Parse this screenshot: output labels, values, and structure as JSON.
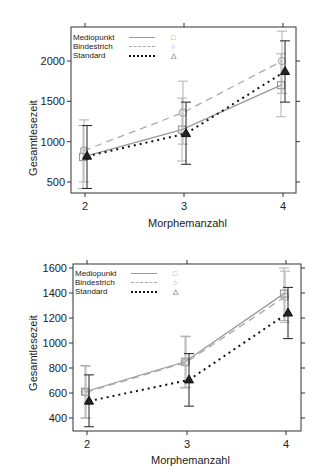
{
  "chart_data": [
    {
      "type": "line",
      "title": "",
      "xlabel": "Morphemanzahl",
      "ylabel": "Gesamtlesezeit",
      "x": [
        2,
        3,
        4
      ],
      "x_ticks": [
        "2",
        "3",
        "4"
      ],
      "y_ticks": [
        500,
        1000,
        1500,
        2000
      ],
      "ylim": [
        330,
        2390
      ],
      "grid": false,
      "legend_position": "top-left inside",
      "error_bars": true,
      "series": [
        {
          "name": "Mediopunkt",
          "line": "solid",
          "marker": "square",
          "color": "#999999",
          "values": [
            810,
            1150,
            1700
          ],
          "lower": [
            420,
            760,
            1310
          ],
          "upper": [
            1200,
            1540,
            2090
          ]
        },
        {
          "name": "Bindestrich",
          "line": "dashed",
          "marker": "circle",
          "color": "#aaaaaa",
          "values": [
            890,
            1360,
            2000
          ],
          "lower": [
            500,
            970,
            1600
          ],
          "upper": [
            1270,
            1750,
            2370
          ]
        },
        {
          "name": "Standard",
          "line": "dotted",
          "marker": "triangle",
          "color": "#111111",
          "values": [
            820,
            1100,
            1870
          ],
          "lower": [
            420,
            720,
            1490
          ],
          "upper": [
            1200,
            1490,
            2250
          ]
        }
      ]
    },
    {
      "type": "line",
      "title": "",
      "xlabel": "Morphemanzahl",
      "ylabel": "Gesamtlesezeit",
      "x": [
        2,
        3,
        4
      ],
      "x_ticks": [
        "2",
        "3",
        "4"
      ],
      "y_ticks": [
        400,
        600,
        800,
        1000,
        1200,
        1400,
        1600
      ],
      "ylim": [
        300,
        1630
      ],
      "grid": false,
      "legend_position": "top-left inside",
      "error_bars": true,
      "series": [
        {
          "name": "Mediopunkt",
          "line": "solid",
          "marker": "square",
          "color": "#999999",
          "values": [
            610,
            850,
            1395
          ],
          "lower": [
            400,
            640,
            1180
          ],
          "upper": [
            820,
            1055,
            1600
          ]
        },
        {
          "name": "Bindestrich",
          "line": "dashed",
          "marker": "circle",
          "color": "#aaaaaa",
          "values": [
            605,
            845,
            1370
          ],
          "lower": [
            400,
            645,
            1165
          ],
          "upper": [
            815,
            1050,
            1575
          ]
        },
        {
          "name": "Standard",
          "line": "dotted",
          "marker": "triangle",
          "color": "#111111",
          "values": [
            535,
            705,
            1240
          ],
          "lower": [
            330,
            495,
            1035
          ],
          "upper": [
            745,
            915,
            1445
          ]
        }
      ]
    }
  ],
  "legend": {
    "entries": [
      {
        "label": "Mediopunkt",
        "marker_glyph": "□"
      },
      {
        "label": "Bindestrich",
        "marker_glyph": "○"
      },
      {
        "label": "Standard",
        "marker_glyph": "△"
      }
    ]
  }
}
